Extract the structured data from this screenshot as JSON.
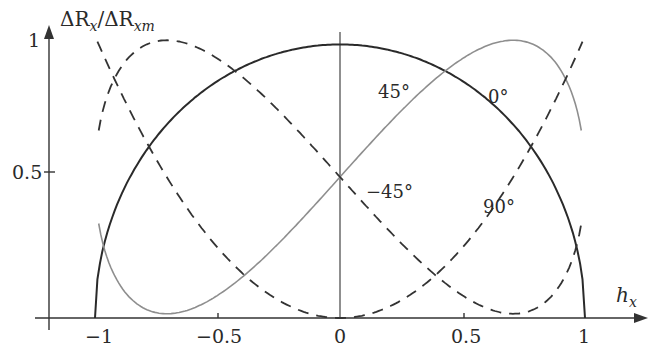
{
  "chart_data": {
    "type": "line",
    "title": "",
    "xlabel": "h_x",
    "ylabel": "ΔR_x/ΔR_xm",
    "xlim": [
      -1.2,
      1.25
    ],
    "ylim": [
      0,
      1.05
    ],
    "grid": false,
    "legend": "none (curves labeled inline)",
    "x_ticks": [
      "-1",
      "-0.5",
      "0",
      "0.5",
      "1"
    ],
    "y_ticks": [
      "0.5",
      "1"
    ],
    "series": [
      {
        "name": "0°",
        "style": "solid dark",
        "formula": "sqrt(1-h^2)",
        "x": [
          -1,
          -0.75,
          -0.5,
          -0.25,
          0,
          0.25,
          0.5,
          0.75,
          1
        ],
        "values": [
          0,
          0.66,
          0.87,
          0.97,
          1.0,
          0.97,
          0.87,
          0.66,
          0
        ]
      },
      {
        "name": "45°",
        "style": "solid gray",
        "formula": "0.5 + h*sqrt(1-h^2)",
        "x": [
          -0.98,
          -0.9,
          -0.707,
          -0.5,
          -0.25,
          0,
          0.25,
          0.5,
          0.707,
          0.9,
          0.98
        ],
        "values": [
          0.4,
          0.11,
          0.0,
          0.07,
          0.26,
          0.5,
          0.74,
          0.93,
          1.0,
          0.89,
          0.6
        ]
      },
      {
        "name": "-45°",
        "style": "dashed",
        "formula": "0.5 - h*sqrt(1-h^2)",
        "x": [
          -0.98,
          -0.9,
          -0.707,
          -0.5,
          -0.25,
          0,
          0.25,
          0.5,
          0.707,
          0.9,
          0.98
        ],
        "values": [
          0.98,
          0.89,
          1.0,
          0.93,
          0.74,
          0.5,
          0.26,
          0.07,
          0.0,
          0.11,
          0.4
        ]
      },
      {
        "name": "90°",
        "style": "dashed",
        "formula": "h^2",
        "x": [
          -1,
          -0.75,
          -0.5,
          -0.25,
          0,
          0.25,
          0.5,
          0.75,
          1
        ],
        "values": [
          1.0,
          0.56,
          0.25,
          0.06,
          0,
          0.06,
          0.25,
          0.56,
          1.0
        ]
      }
    ],
    "annotations": [
      "45°",
      "0°",
      "-45°",
      "90°"
    ]
  },
  "labels": {
    "ylabel_main": "ΔR",
    "ylabel_sub1": "x",
    "ylabel_slash": "/ΔR",
    "ylabel_sub2": "xm",
    "xlabel_main": "h",
    "xlabel_sub": "x",
    "ytick_1": "1",
    "ytick_05": "0.5",
    "xtick_m1": "−1",
    "xtick_m05": "−0.5",
    "xtick_0": "0",
    "xtick_05": "0.5",
    "xtick_1": "1",
    "anno_45": "45°",
    "anno_0": "0°",
    "anno_m45": "−45°",
    "anno_90": "90°"
  }
}
